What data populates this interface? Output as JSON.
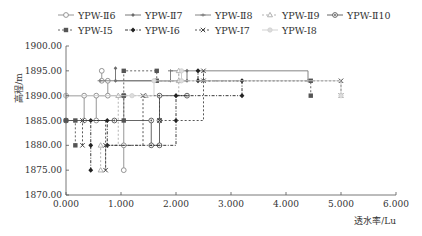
{
  "chart_data": {
    "type": "line",
    "title": "",
    "xlabel": "透水率/Lu",
    "ylabel": "高程/m",
    "xlim": [
      0,
      6
    ],
    "ylim": [
      1870,
      1900
    ],
    "x_ticks": [
      "0.000",
      "1.000",
      "2.000",
      "3.000",
      "4.000",
      "5.000",
      "6.000"
    ],
    "y_ticks": [
      "1870.00",
      "1875.00",
      "1880.00",
      "1885.00",
      "1890.00",
      "1895.00",
      "1900.00"
    ],
    "grid": false,
    "legend_position": "top",
    "step_style": "vertical segments connect elevation intervals at same permeability",
    "series": [
      {
        "name": "YPW-Ⅱ6",
        "marker": "circle-open",
        "line": "solid",
        "color": "#8a8a8a",
        "points": [
          [
            0.65,
            1895
          ],
          [
            0.65,
            1893
          ],
          [
            0.76,
            1893
          ],
          [
            0.76,
            1890
          ],
          [
            0.0,
            1890
          ],
          [
            0.33,
            1890
          ],
          [
            0.33,
            1885
          ],
          [
            0.55,
            1885
          ],
          [
            0.55,
            1890
          ],
          [
            1.05,
            1890
          ],
          [
            1.05,
            1880
          ],
          [
            1.05,
            1875
          ]
        ]
      },
      {
        "name": "YPW-Ⅱ7",
        "marker": "diamond-small",
        "line": "solid",
        "color": "#6a6a6a",
        "points": [
          [
            0.9,
            1895.5
          ],
          [
            0.9,
            1893
          ],
          [
            2.2,
            1893
          ],
          [
            2.2,
            1895
          ]
        ]
      },
      {
        "name": "YPW-Ⅱ8",
        "marker": "dash-cross",
        "line": "solid",
        "color": "#777777",
        "points": [
          [
            0.62,
            1893
          ],
          [
            1.9,
            1893
          ],
          [
            1.9,
            1895
          ],
          [
            4.4,
            1893
          ]
        ]
      },
      {
        "name": "YPW-Ⅱ9",
        "marker": "triangle-open",
        "line": "dash",
        "color": "#aaaaaa",
        "points": [
          [
            0.63,
            1875
          ],
          [
            0.63,
            1880
          ],
          [
            0.95,
            1890
          ],
          [
            1.45,
            1890
          ],
          [
            2.05,
            1895
          ],
          [
            2.05,
            1893
          ]
        ]
      },
      {
        "name": "YPW-Ⅱ10",
        "marker": "circle-dot",
        "line": "solid",
        "color": "#555555",
        "points": [
          [
            0.0,
            1885
          ],
          [
            0.88,
            1885
          ],
          [
            1.55,
            1885
          ],
          [
            1.55,
            1880
          ],
          [
            1.7,
            1880
          ],
          [
            1.7,
            1885
          ],
          [
            1.7,
            1890
          ],
          [
            2.2,
            1890
          ]
        ]
      },
      {
        "name": "YPW-Ⅰ5",
        "marker": "square-filled",
        "line": "dash",
        "color": "#555555",
        "points": [
          [
            0.17,
            1880
          ],
          [
            0.17,
            1885
          ],
          [
            0.0,
            1885
          ],
          [
            1.05,
            1885
          ],
          [
            1.05,
            1890
          ],
          [
            1.05,
            1895
          ],
          [
            1.65,
            1895
          ],
          [
            1.65,
            1893
          ],
          [
            4.45,
            1893
          ],
          [
            4.45,
            1890
          ]
        ]
      },
      {
        "name": "YPW-Ⅰ6",
        "marker": "diamond-filled",
        "line": "dash-dot",
        "color": "#222222",
        "points": [
          [
            0.45,
            1875
          ],
          [
            0.45,
            1880
          ],
          [
            0.45,
            1885
          ],
          [
            0.75,
            1885
          ],
          [
            0.75,
            1880
          ],
          [
            2.0,
            1885
          ],
          [
            2.0,
            1890
          ],
          [
            3.2,
            1890
          ],
          [
            3.2,
            1893
          ],
          [
            2.4,
            1893
          ],
          [
            2.4,
            1895
          ]
        ]
      },
      {
        "name": "YPW-Ⅰ7",
        "marker": "x-cross",
        "line": "dash",
        "color": "#444444",
        "points": [
          [
            0.3,
            1880
          ],
          [
            0.3,
            1885
          ],
          [
            0.72,
            1875
          ],
          [
            0.72,
            1880
          ],
          [
            1.4,
            1890
          ],
          [
            1.7,
            1885
          ],
          [
            2.5,
            1895
          ],
          [
            2.5,
            1893
          ],
          [
            5.0,
            1893
          ],
          [
            5.0,
            1890
          ]
        ]
      },
      {
        "name": "YPW-Ⅰ8",
        "marker": "circle-light",
        "line": "solid",
        "color": "#cccccc",
        "points": [
          [
            0.0,
            1890
          ],
          [
            1.2,
            1890
          ],
          [
            1.6,
            1893
          ],
          [
            2.1,
            1895
          ],
          [
            2.1,
            1893
          ],
          [
            5.0,
            1890
          ]
        ]
      }
    ]
  },
  "legend": {
    "row1": [
      "YPW-Ⅱ6",
      "YPW-Ⅱ7",
      "YPW-Ⅱ8",
      "YPW-Ⅱ9",
      "YPW-Ⅱ10"
    ],
    "row2": [
      "YPW-Ⅰ5",
      "YPW-Ⅰ6",
      "YPW-Ⅰ7",
      "YPW-Ⅰ8"
    ]
  },
  "axes": {
    "xlabel": "透水率/Lu",
    "ylabel": "高程/m"
  }
}
